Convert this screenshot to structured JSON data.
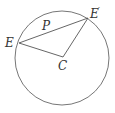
{
  "diagram": {
    "type": "geometry",
    "circle": {
      "cx": 62,
      "cy": 58,
      "r": 47,
      "stroke": "#666666"
    },
    "points": {
      "E": {
        "x": 19,
        "y": 43,
        "label": "E"
      },
      "E_prime": {
        "x": 88,
        "y": 18,
        "label": "E",
        "prime": "′"
      },
      "C": {
        "x": 63,
        "y": 63,
        "label": "C"
      },
      "P": {
        "x": 46,
        "y": 33,
        "label": "P"
      }
    },
    "segments": [
      [
        "E",
        "E_prime"
      ],
      [
        "E",
        "C"
      ],
      [
        "C",
        "E_prime"
      ]
    ],
    "line_color": "#555555"
  }
}
